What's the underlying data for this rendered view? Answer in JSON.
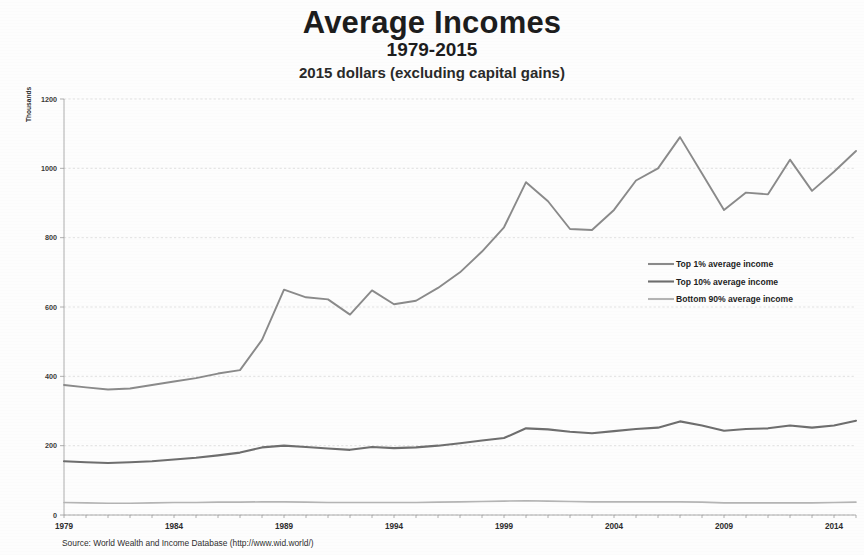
{
  "title": {
    "main": "Average Incomes",
    "subtitle": "1979-2015",
    "note": "2015 dollars (excluding capital gains)"
  },
  "source": "Source: World Wealth and Income Database (http://www.wid.world/)",
  "axis": {
    "y_unit_label": "Thousands",
    "y_ticks": [
      "0",
      "200",
      "400",
      "600",
      "800",
      "1000",
      "1200"
    ],
    "x_ticks": [
      "1979",
      "1984",
      "1989",
      "1994",
      "1999",
      "2004",
      "2009",
      "2014"
    ]
  },
  "legend": {
    "items": [
      {
        "label": "Top 1% average income",
        "color": "#8a8a8a"
      },
      {
        "label": "Top 10% average income",
        "color": "#6e6e6e"
      },
      {
        "label": "Bottom 90% average income",
        "color": "#b4b4b4"
      }
    ]
  },
  "chart_data": {
    "type": "line",
    "title": "Average Incomes",
    "subtitle": "1979-2015",
    "annotation": "2015 dollars (excluding capital gains)",
    "xlabel": "",
    "ylabel": "Thousands",
    "ylim": [
      0,
      1200
    ],
    "ytick_step": 200,
    "grid": true,
    "legend_position": "right-middle",
    "x": [
      1979,
      1980,
      1981,
      1982,
      1983,
      1984,
      1985,
      1986,
      1987,
      1988,
      1989,
      1990,
      1991,
      1992,
      1993,
      1994,
      1995,
      1996,
      1997,
      1998,
      1999,
      2000,
      2001,
      2002,
      2003,
      2004,
      2005,
      2006,
      2007,
      2008,
      2009,
      2010,
      2011,
      2012,
      2013,
      2014,
      2015
    ],
    "series": [
      {
        "name": "Top 1% average income",
        "color": "#8a8a8a",
        "values": [
          375,
          368,
          362,
          365,
          375,
          385,
          395,
          408,
          418,
          505,
          650,
          628,
          622,
          578,
          648,
          608,
          618,
          655,
          700,
          760,
          830,
          960,
          905,
          825,
          822,
          880,
          965,
          1000,
          1090,
          985,
          880,
          930,
          925,
          1025,
          935,
          990,
          1050
        ]
      },
      {
        "name": "Top 10% average income",
        "color": "#6e6e6e",
        "values": [
          155,
          152,
          150,
          152,
          155,
          160,
          165,
          172,
          180,
          195,
          200,
          196,
          192,
          188,
          196,
          193,
          195,
          200,
          207,
          215,
          222,
          250,
          247,
          240,
          236,
          242,
          248,
          252,
          270,
          258,
          243,
          248,
          250,
          258,
          252,
          258,
          272
        ]
      },
      {
        "name": "Bottom 90% average income",
        "color": "#b4b4b4",
        "values": [
          36,
          35,
          34,
          34,
          35,
          36,
          36,
          37,
          37,
          38,
          38,
          37,
          36,
          36,
          36,
          36,
          36,
          37,
          38,
          39,
          40,
          41,
          40,
          39,
          38,
          38,
          38,
          38,
          38,
          37,
          35,
          35,
          35,
          35,
          35,
          36,
          37
        ]
      }
    ]
  }
}
